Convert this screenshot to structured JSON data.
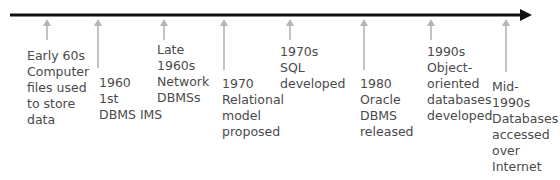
{
  "diagram": {
    "type": "timeline",
    "axis_color": "#111111",
    "tick_color": "#b5b5b5",
    "text_color": "#4a4a4a",
    "events": [
      {
        "lines": [
          "Early 60s",
          "Computer",
          "files used",
          "to store",
          "data"
        ]
      },
      {
        "lines": [
          "1960",
          "1st",
          "DBMS IMS"
        ]
      },
      {
        "lines": [
          "Late",
          "1960s",
          "Network",
          "DBMSs"
        ]
      },
      {
        "lines": [
          "1970",
          "Relational",
          "model",
          "proposed"
        ]
      },
      {
        "lines": [
          "1970s",
          "SQL",
          "developed"
        ]
      },
      {
        "lines": [
          "1980",
          "Oracle",
          "DBMS",
          "released"
        ]
      },
      {
        "lines": [
          "1990s",
          "Object-",
          "oriented",
          "databases",
          "developed"
        ]
      },
      {
        "lines": [
          "Mid-",
          "1990s",
          "Databases",
          "accessed",
          "over",
          "Internet"
        ]
      }
    ]
  }
}
